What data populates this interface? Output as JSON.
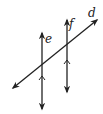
{
  "diagram": {
    "type": "geometry-parallel-lines-transversal",
    "labels": {
      "transversal": "d",
      "line_left": "e",
      "line_right": "f"
    },
    "stroke_color": "#222222",
    "background": "#ffffff",
    "parallel_marks": "single arrow on e and f (e ∥ f)"
  }
}
